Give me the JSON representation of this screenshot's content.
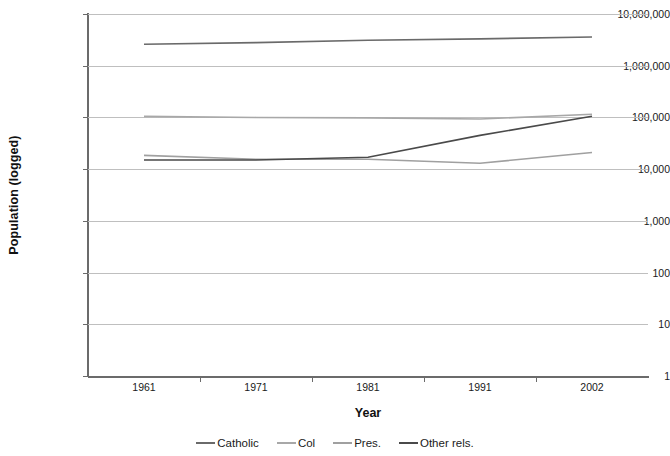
{
  "chart_data": {
    "type": "line",
    "title": "",
    "xlabel": "Year",
    "ylabel": "Population (logged)",
    "x_categories": [
      "1961",
      "1971",
      "1981",
      "1991",
      "2002"
    ],
    "y_scale": "log",
    "ylim": [
      1,
      10000000
    ],
    "y_tick_labels": [
      "10,000,000",
      "1,000,000",
      "100,000",
      "10,000",
      "1,000",
      "100",
      "10",
      "1"
    ],
    "y_tick_values": [
      10000000,
      1000000,
      100000,
      10000,
      1000,
      100,
      10,
      1
    ],
    "grid": "horizontal",
    "legend_position": "bottom",
    "series": [
      {
        "name": "Catholic",
        "color": "#6a6a6a",
        "values": [
          2600000,
          2800000,
          3100000,
          3300000,
          3600000
        ]
      },
      {
        "name": "Col",
        "color": "#a8a8a8",
        "values": [
          105000,
          100000,
          98000,
          93000,
          115000
        ]
      },
      {
        "name": "Pres.",
        "color": "#a0a0a0",
        "values": [
          18500,
          15500,
          15500,
          13000,
          21000
        ]
      },
      {
        "name": "Other rels.",
        "color": "#4a4a4a",
        "values": [
          15000,
          15000,
          17000,
          45000,
          105000
        ]
      }
    ]
  },
  "axes": {
    "y_title": "Population (logged)",
    "x_title": "Year"
  },
  "colors": {
    "gridline": "#bfbfbf",
    "axis": "#6b6b6b",
    "text": "#1a1a1a",
    "background": "#ffffff"
  }
}
